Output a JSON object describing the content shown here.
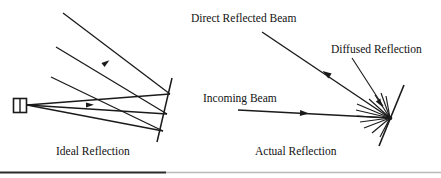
{
  "figure": {
    "background_color": "#ffffff",
    "ink_color": "#1a1a1a",
    "width": 441,
    "height": 178
  },
  "left_panel": {
    "caption": "Ideal Reflection",
    "source_label": "light-source",
    "elements": {
      "source_box": "emitter",
      "mirror": "reflecting-surface",
      "rays": "specular-ray-bundle"
    }
  },
  "right_panel": {
    "caption": "Actual Reflection",
    "labels": {
      "direct": "Direct Reflected Beam",
      "diffused": "Diffused Reflection",
      "incoming": "Incoming Beam"
    },
    "elements": {
      "mirror": "reflecting-surface",
      "scatter": "diffuse-ray-fan"
    }
  },
  "footer": {
    "rule": "horizontal-divider"
  }
}
